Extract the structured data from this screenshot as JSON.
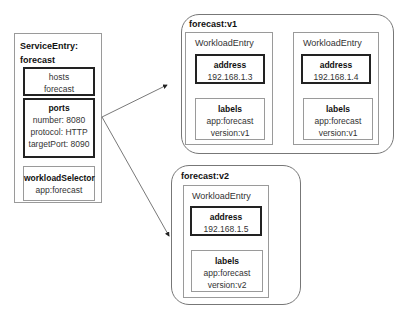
{
  "service_entry": {
    "title_line1": "ServiceEntry:",
    "title_line2": "forecast",
    "hosts": {
      "label": "hosts",
      "value": "forecast"
    },
    "ports": {
      "label": "ports",
      "number": "number: 8080",
      "protocol": "protocol: HTTP",
      "target_port": "targetPort: 8090"
    },
    "workload_selector": {
      "label": "workloadSelector",
      "value": "app:forecast"
    }
  },
  "groups": [
    {
      "title": "forecast:v1",
      "entries": [
        {
          "title": "WorkloadEntry",
          "address_label": "address",
          "address": "192.168.1.3",
          "labels_label": "labels",
          "app": "app:forecast",
          "version": "version:v1"
        },
        {
          "title": "WorkloadEntry",
          "address_label": "address",
          "address": "192.168.1.4",
          "labels_label": "labels",
          "app": "app:forecast",
          "version": "version:v1"
        }
      ]
    },
    {
      "title": "forecast:v2",
      "entries": [
        {
          "title": "WorkloadEntry",
          "address_label": "address",
          "address": "192.168.1.5",
          "labels_label": "labels",
          "app": "app:forecast",
          "version": "version:v2"
        }
      ]
    }
  ],
  "arrows": [
    {
      "from": "service-entry",
      "to": "forecast:v1"
    },
    {
      "from": "service-entry",
      "to": "forecast:v2"
    }
  ]
}
